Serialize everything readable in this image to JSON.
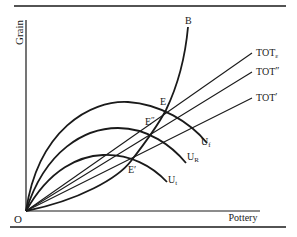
{
  "diagram": {
    "axes": {
      "x_label": "Pottery",
      "y_label": "Grain",
      "origin_label": "O"
    },
    "curves": {
      "offer_curve": {
        "label": "B"
      },
      "indifference": [
        {
          "label": "U",
          "subscript": "f"
        },
        {
          "label": "U",
          "subscript": "R"
        },
        {
          "label": "U",
          "subscript": "t"
        }
      ]
    },
    "terms_of_trade_lines": [
      {
        "label": "TOT",
        "suffix": "ε",
        "suffix_type": "subscript"
      },
      {
        "label": "TOT",
        "suffix": "″",
        "suffix_type": "superscript"
      },
      {
        "label": "TOT",
        "suffix": "′",
        "suffix_type": "superscript"
      }
    ],
    "points": [
      {
        "label": "E",
        "prime": ""
      },
      {
        "label": "E",
        "prime": "″"
      },
      {
        "label": "E",
        "prime": "′"
      }
    ]
  }
}
